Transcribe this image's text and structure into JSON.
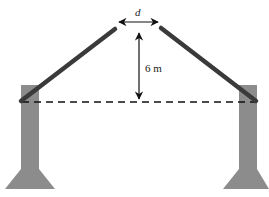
{
  "diagram": {
    "labels": {
      "gap": "d",
      "height": "6 m"
    },
    "colors": {
      "pillar": "#8c8c8c",
      "rod": "#3a3a3a",
      "line": "#111111",
      "background": "#ffffff"
    }
  }
}
